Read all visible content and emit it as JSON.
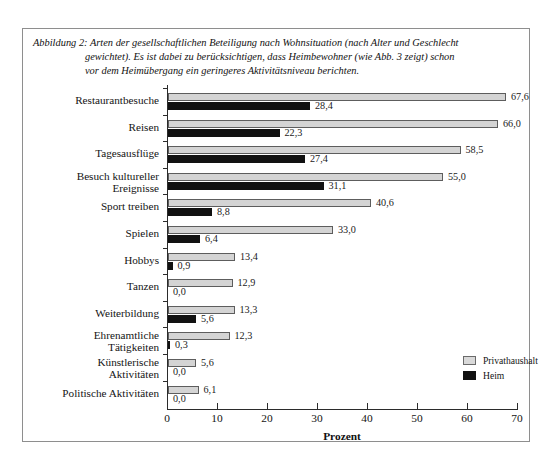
{
  "figure": {
    "caption_line1": "Abbildung 2: Arten der gesellschaftlichen Beteiligung nach Wohnsituation (nach Alter und Geschlecht",
    "caption_line2": "gewichtet). Es ist dabei zu berücksichtigen, dass Heimbewohner (wie Abb. 3 zeigt) schon",
    "caption_line3": "vor dem Heimübergang ein geringeres Aktivitätsniveau berichten."
  },
  "legend": {
    "position": "inside-bottom-right",
    "entries": [
      {
        "label": "Privathaushalt",
        "color": "#d4d4d4"
      },
      {
        "label": "Heim",
        "color": "#111111"
      }
    ]
  },
  "chart_data": {
    "type": "bar",
    "orientation": "horizontal",
    "title": "",
    "xlabel": "Prozent",
    "ylabel": "",
    "xlim": [
      0,
      70
    ],
    "xticks": [
      "0",
      "10",
      "20",
      "30",
      "40",
      "50",
      "60",
      "70"
    ],
    "grid": false,
    "categories": [
      "Restaurantbesuche",
      "Reisen",
      "Tagesausflüge",
      "Besuch kultureller Ereignisse",
      "Sport treiben",
      "Spielen",
      "Hobbys",
      "Tanzen",
      "Weiterbildung",
      "Ehrenamtliche Tätigkeiten",
      "Künstlerische Aktivitäten",
      "Politische Aktivitäten"
    ],
    "series": [
      {
        "name": "Privathaushalt",
        "color": "#d4d4d4",
        "values": [
          67.6,
          66.0,
          58.5,
          55.0,
          40.6,
          33.0,
          13.4,
          12.9,
          13.3,
          12.3,
          5.6,
          6.1
        ],
        "labels": [
          "67,6",
          "66,0",
          "58,5",
          "55,0",
          "40,6",
          "33,0",
          "13,4",
          "12,9",
          "13,3",
          "12,3",
          "5,6",
          "6,1"
        ]
      },
      {
        "name": "Heim",
        "color": "#111111",
        "values": [
          28.4,
          22.3,
          27.4,
          31.1,
          8.8,
          6.4,
          0.9,
          0.0,
          5.6,
          0.3,
          0.0,
          0.0
        ],
        "labels": [
          "28,4",
          "22,3",
          "27,4",
          "31,1",
          "8,8",
          "6,4",
          "0,9",
          "0,0",
          "5,6",
          "0,3",
          "0,0",
          "0,0"
        ]
      }
    ]
  }
}
